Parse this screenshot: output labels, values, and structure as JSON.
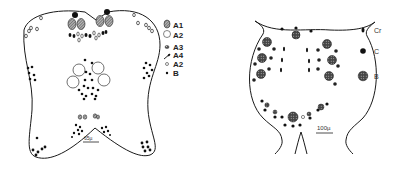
{
  "left_figure": {
    "legend": [
      {
        "symbol": "hatched-large-oval",
        "label": "A1"
      },
      {
        "symbol": "open-large-oval",
        "label": "A2"
      },
      {
        "symbol": "dark-stippled-small",
        "label": "A3"
      },
      {
        "symbol": "elongated-dash",
        "label": "A4"
      },
      {
        "symbol": "small-open-circle",
        "label": "A2"
      },
      {
        "symbol": "small-dot",
        "label": "B"
      }
    ],
    "scale_bar": "65µ"
  },
  "right_figure": {
    "legend": [
      {
        "symbol": "small-oval-dark",
        "label": "Cr"
      },
      {
        "symbol": "medium-dark-circle",
        "label": "C"
      },
      {
        "symbol": "large-stippled-circle",
        "label": "B"
      }
    ],
    "scale_bar": "100µ"
  },
  "colors": {
    "ink": "#1a1a1a",
    "background": "#ffffff"
  }
}
